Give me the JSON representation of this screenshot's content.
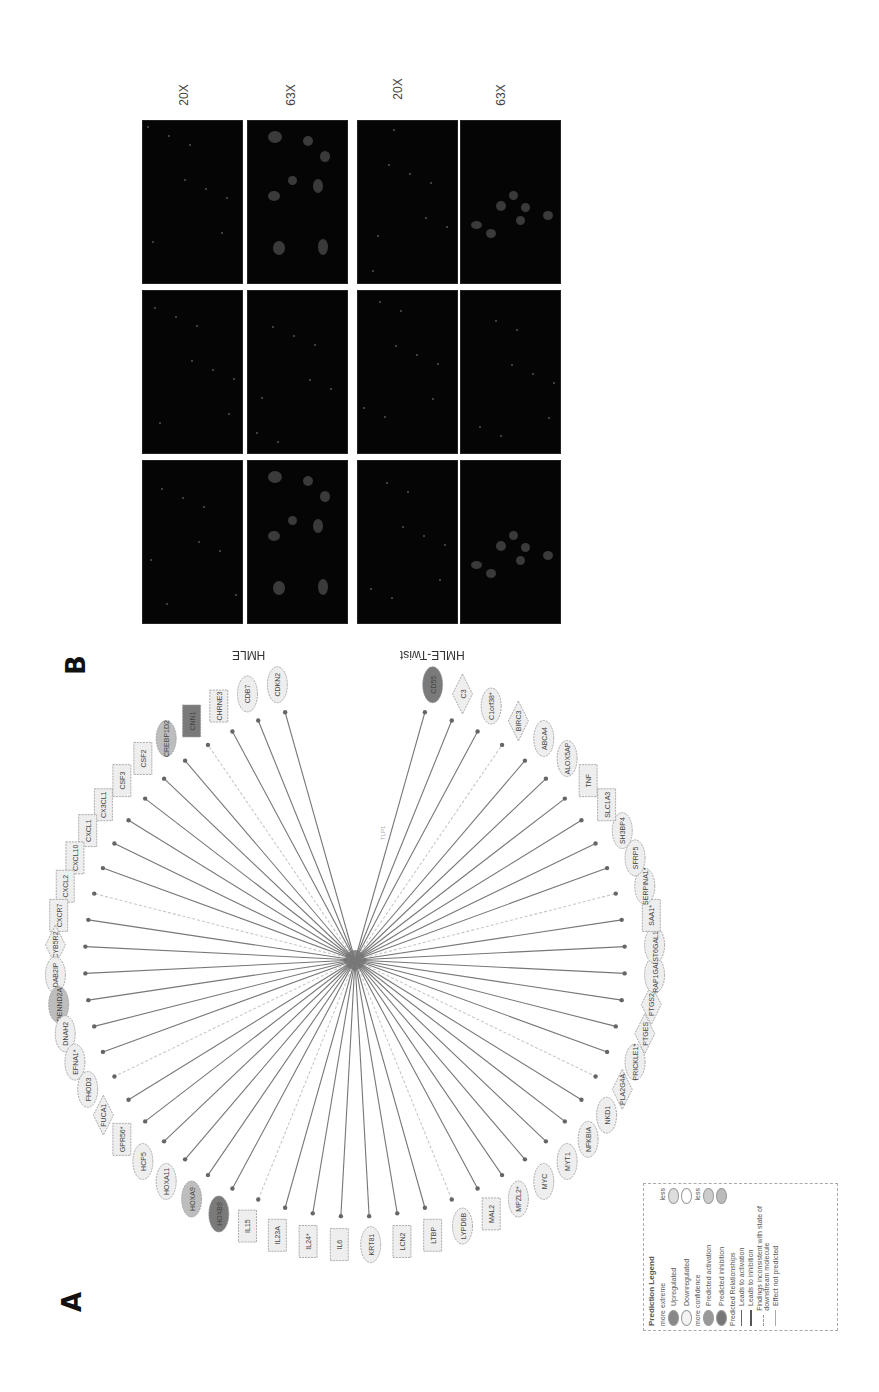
{
  "figure": {
    "panel_a_label": "A",
    "panel_b_label": "B"
  },
  "network": {
    "center_node": "TWIST1",
    "center_label_near": "TLP1",
    "nodes": [
      {
        "label": "CDKN2",
        "shape": "ellipse",
        "fill": "light"
      },
      {
        "label": "CDB7",
        "shape": "ellipse",
        "fill": "light"
      },
      {
        "label": "CHRNE3",
        "shape": "rect",
        "fill": "light"
      },
      {
        "label": "CNN1",
        "shape": "rect",
        "fill": "dark"
      },
      {
        "label": "CREBP1D2",
        "shape": "ellipse",
        "fill": "medium"
      },
      {
        "label": "CSF2",
        "shape": "rect",
        "fill": "light"
      },
      {
        "label": "CSF3",
        "shape": "rect",
        "fill": "light"
      },
      {
        "label": "CX3CL1",
        "shape": "rect",
        "fill": "light"
      },
      {
        "label": "CXCL1",
        "shape": "rect",
        "fill": "light"
      },
      {
        "label": "CXCL10",
        "shape": "rect",
        "fill": "light"
      },
      {
        "label": "CXCL2",
        "shape": "rect",
        "fill": "light"
      },
      {
        "label": "CXCR7",
        "shape": "rect",
        "fill": "light"
      },
      {
        "label": "CYB5R2",
        "shape": "diamond",
        "fill": "light"
      },
      {
        "label": "DAB2IP",
        "shape": "ellipse",
        "fill": "light"
      },
      {
        "label": "DENND2A",
        "shape": "ellipse",
        "fill": "medium"
      },
      {
        "label": "DNAH2",
        "shape": "ellipse",
        "fill": "light"
      },
      {
        "label": "EFNA1*",
        "shape": "ellipse",
        "fill": "light"
      },
      {
        "label": "FHOD3",
        "shape": "ellipse",
        "fill": "light"
      },
      {
        "label": "FUCA1",
        "shape": "diamond",
        "fill": "light"
      },
      {
        "label": "GPR56*",
        "shape": "rect",
        "fill": "light"
      },
      {
        "label": "HCP5",
        "shape": "ellipse",
        "fill": "light"
      },
      {
        "label": "HOXA11",
        "shape": "ellipse",
        "fill": "light"
      },
      {
        "label": "HOXA9",
        "shape": "ellipse",
        "fill": "medium"
      },
      {
        "label": "HOXB9",
        "shape": "ellipse",
        "fill": "dark"
      },
      {
        "label": "IL15",
        "shape": "rect",
        "fill": "light"
      },
      {
        "label": "IL23A",
        "shape": "rect",
        "fill": "light"
      },
      {
        "label": "IL24*",
        "shape": "rect",
        "fill": "light"
      },
      {
        "label": "IL6",
        "shape": "rect",
        "fill": "light"
      },
      {
        "label": "KRT81",
        "shape": "ellipse",
        "fill": "light"
      },
      {
        "label": "LCN2",
        "shape": "rect",
        "fill": "light"
      },
      {
        "label": "LTBP",
        "shape": "rect",
        "fill": "light"
      },
      {
        "label": "LYPD6B",
        "shape": "ellipse",
        "fill": "light"
      },
      {
        "label": "MAL2",
        "shape": "rect",
        "fill": "light"
      },
      {
        "label": "MPZL2*",
        "shape": "ellipse",
        "fill": "light"
      },
      {
        "label": "MYC",
        "shape": "ellipse",
        "fill": "light"
      },
      {
        "label": "MYT1",
        "shape": "ellipse",
        "fill": "light"
      },
      {
        "label": "NFKBIA",
        "shape": "ellipse",
        "fill": "light"
      },
      {
        "label": "NKD1",
        "shape": "ellipse",
        "fill": "light"
      },
      {
        "label": "PLA2G4A",
        "shape": "diamond",
        "fill": "light"
      },
      {
        "label": "PRICKLE1*",
        "shape": "ellipse",
        "fill": "light"
      },
      {
        "label": "PTGES",
        "shape": "diamond",
        "fill": "light"
      },
      {
        "label": "PTGS2",
        "shape": "diamond",
        "fill": "light"
      },
      {
        "label": "RAP1GAP*",
        "shape": "ellipse",
        "fill": "light"
      },
      {
        "label": "ST6GAL1*",
        "shape": "ellipse",
        "fill": "light"
      },
      {
        "label": "SAA1*",
        "shape": "rect",
        "fill": "light"
      },
      {
        "label": "SERPINA1*",
        "shape": "ellipse",
        "fill": "light"
      },
      {
        "label": "SFRP5",
        "shape": "ellipse",
        "fill": "light"
      },
      {
        "label": "SH3BP4",
        "shape": "ellipse",
        "fill": "light"
      },
      {
        "label": "SLC1A3",
        "shape": "rect",
        "fill": "light"
      },
      {
        "label": "TNF",
        "shape": "rect",
        "fill": "light"
      },
      {
        "label": "ALOX5AP",
        "shape": "ellipse",
        "fill": "light"
      },
      {
        "label": "ABCA4",
        "shape": "ellipse",
        "fill": "light"
      },
      {
        "label": "BIRC3",
        "shape": "diamond",
        "fill": "light"
      },
      {
        "label": "C1orf38*",
        "shape": "ellipse",
        "fill": "light"
      },
      {
        "label": "C3",
        "shape": "diamond",
        "fill": "light"
      },
      {
        "label": "CD55",
        "shape": "ellipse",
        "fill": "dark"
      }
    ],
    "legend": {
      "title": "Prediction Legend",
      "section_expression": "more extreme",
      "expression_less": "less",
      "upregulated": "Upregulated",
      "downregulated": "Downregulated",
      "section_confidence": "more confidence",
      "confidence_less": "less",
      "predicted_activation": "Predicted activation",
      "predicted_inhibition": "Predicted inhibition",
      "section_relationships": "Predicted Relationships",
      "leads_to_activation": "Leads to activation",
      "leads_to_inhibition": "Leads to inhibition",
      "findings_inconsistent": "Findings inconsistent with state of downstream molecule",
      "effect_not_predicted": "Effect not predicted"
    }
  },
  "microscopy": {
    "columns": [
      "DAPI",
      "pEZH2",
      "Merge"
    ],
    "row_groups": [
      {
        "label": "HMLE",
        "magnifications": [
          "20X",
          "63X"
        ]
      },
      {
        "label": "HMLE-Twist",
        "magnifications": [
          "20X",
          "63X"
        ]
      }
    ]
  },
  "colors": {
    "background": "#ffffff",
    "panel_black": "#050505",
    "node_dark": "#7a7a7a",
    "node_medium": "#bdbdbd",
    "node_light": "#eeeeee",
    "edge": "#777777"
  }
}
